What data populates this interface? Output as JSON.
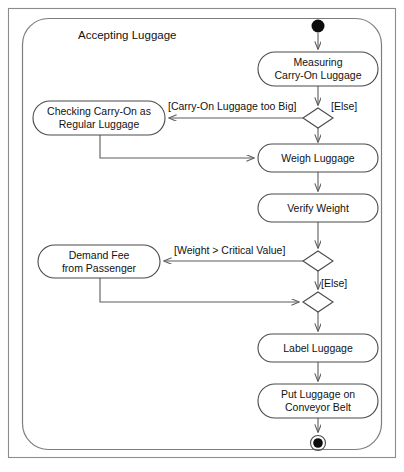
{
  "diagram": {
    "type": "uml-activity-diagram",
    "title": "Accepting Luggage",
    "frame": {
      "x": 8,
      "y": 8,
      "width": 388,
      "height": 450
    },
    "boundary": {
      "x": 22,
      "y": 18,
      "width": 360,
      "height": 432,
      "corner_radius": 26
    },
    "colors": {
      "background": "#ffffff",
      "node_stroke": "#4a4a4a",
      "edge_stroke": "#5c5c5c",
      "frame_stroke": "#8c8c8c",
      "text": "#121212",
      "terminal_fill": "#0d0d0d"
    },
    "nodes": [
      {
        "id": "start",
        "kind": "initial-node",
        "label": "",
        "cx": 318,
        "cy": 26,
        "r": 6.5
      },
      {
        "id": "measuring",
        "kind": "action",
        "label_line1": "Measuring",
        "label_line2": "Carry-On Luggage",
        "x": 258,
        "y": 52,
        "width": 120,
        "height": 34
      },
      {
        "id": "decision1",
        "kind": "decision-node",
        "label": "",
        "cx": 318,
        "cy": 118,
        "hw": 15,
        "hh": 10
      },
      {
        "id": "checking",
        "kind": "action",
        "label_line1": "Checking Carry-On as",
        "label_line2": "Regular Luggage",
        "x": 33,
        "y": 101,
        "width": 132,
        "height": 34
      },
      {
        "id": "merge1",
        "kind": "merge-node",
        "label": "",
        "cx": 318,
        "cy": 141,
        "hw": 0,
        "hh": 0
      },
      {
        "id": "weigh",
        "kind": "action",
        "label_line1": "Weigh Luggage",
        "label_line2": "",
        "x": 258,
        "y": 144,
        "width": 120,
        "height": 28
      },
      {
        "id": "verify",
        "kind": "action",
        "label_line1": "Verify Weight",
        "label_line2": "",
        "x": 258,
        "y": 194,
        "width": 120,
        "height": 28
      },
      {
        "id": "decision2",
        "kind": "decision-node",
        "label": "",
        "cx": 318,
        "cy": 261,
        "hw": 15,
        "hh": 10
      },
      {
        "id": "demandfee",
        "kind": "action",
        "label_line1": "Demand Fee",
        "label_line2": "from Passenger",
        "x": 38,
        "y": 245,
        "width": 122,
        "height": 33
      },
      {
        "id": "merge2",
        "kind": "merge-node",
        "label": "",
        "cx": 318,
        "cy": 302,
        "hw": 15,
        "hh": 10
      },
      {
        "id": "label",
        "kind": "action",
        "label_line1": "Label Luggage",
        "label_line2": "",
        "x": 258,
        "y": 334,
        "width": 120,
        "height": 28
      },
      {
        "id": "conveyor",
        "kind": "action",
        "label_line1": "Put Luggage on",
        "label_line2": "Conveyor Belt",
        "x": 258,
        "y": 384,
        "width": 120,
        "height": 34
      },
      {
        "id": "end",
        "kind": "final-node",
        "label": "",
        "cx": 318,
        "cy": 443,
        "r_outer": 7.5,
        "r_inner": 4.5
      }
    ],
    "guards": [
      {
        "id": "guard-carry-on-too-big",
        "text": "[Carry-On Luggage too Big]",
        "x": 168,
        "y": 106,
        "anchor": "start"
      },
      {
        "id": "guard-else-1",
        "text": "[Else]",
        "x": 330,
        "y": 110,
        "anchor": "start"
      },
      {
        "id": "guard-weight-critical",
        "text": "[Weight > Critical Value]",
        "x": 173,
        "y": 250,
        "anchor": "start"
      },
      {
        "id": "guard-else-2",
        "text": "[Else]",
        "x": 320,
        "y": 285,
        "anchor": "start"
      }
    ],
    "edges": [
      {
        "id": "edge-start-to-measuring",
        "from": "start",
        "to": "measuring",
        "path": "M318,33 L318,51",
        "arrow": true
      },
      {
        "id": "edge-measuring-to-decision1",
        "from": "measuring",
        "to": "decision1",
        "path": "M318,86 L318,107",
        "arrow": true
      },
      {
        "id": "edge-decision1-to-checking",
        "from": "decision1",
        "to": "checking",
        "path": "M303,118 L167,118",
        "arrow": true
      },
      {
        "id": "edge-decision1-to-merge1",
        "from": "decision1",
        "to": "weigh",
        "path": "M318,128 L318,143",
        "arrow": true
      },
      {
        "id": "edge-checking-to-weigh",
        "from": "checking",
        "to": "weigh",
        "path": "M100,135 L100,158 L256,158",
        "arrow": true
      },
      {
        "id": "edge-weigh-to-verify",
        "from": "weigh",
        "to": "verify",
        "path": "M318,172 L318,193",
        "arrow": true
      },
      {
        "id": "edge-verify-to-decision2",
        "from": "verify",
        "to": "decision2",
        "path": "M318,222 L318,250",
        "arrow": true
      },
      {
        "id": "edge-decision2-to-demandfee",
        "from": "decision2",
        "to": "demandfee",
        "path": "M303,261 L162,261",
        "arrow": true
      },
      {
        "id": "edge-decision2-to-merge2",
        "from": "decision2",
        "to": "merge2",
        "path": "M318,271 L318,291",
        "arrow": true
      },
      {
        "id": "edge-demandfee-to-merge2",
        "from": "demandfee",
        "to": "merge2",
        "path": "M100,278 L100,302 L301,302",
        "arrow": true
      },
      {
        "id": "edge-merge2-to-label",
        "from": "merge2",
        "to": "label",
        "path": "M318,312 L318,333",
        "arrow": true
      },
      {
        "id": "edge-label-to-conveyor",
        "from": "label",
        "to": "conveyor",
        "path": "M318,362 L318,383",
        "arrow": true
      },
      {
        "id": "edge-conveyor-to-end",
        "from": "conveyor",
        "to": "end",
        "path": "M318,418 L318,434",
        "arrow": true
      }
    ]
  }
}
